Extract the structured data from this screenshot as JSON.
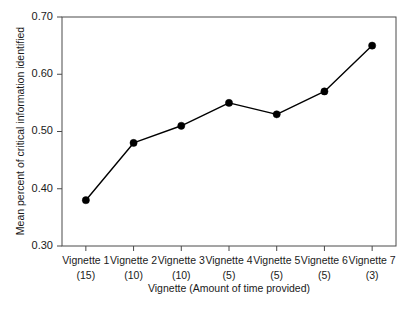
{
  "chart_data": {
    "type": "line",
    "title": "",
    "xlabel": "Vignette (Amount of time provided)",
    "ylabel": "Mean percent of critical information identified",
    "categories": [
      "Vignette 1",
      "Vignette 2",
      "Vignette 3",
      "Vignette 4",
      "Vignette 5",
      "Vignette 6",
      "Vignette 7"
    ],
    "category_sublabels": [
      "(15)",
      "(10)",
      "(10)",
      "(5)",
      "(5)",
      "(5)",
      "(3)"
    ],
    "time_provided": [
      15,
      10,
      10,
      5,
      5,
      5,
      3
    ],
    "values": [
      0.38,
      0.48,
      0.51,
      0.55,
      0.53,
      0.57,
      0.65
    ],
    "ylim": [
      0.3,
      0.7
    ],
    "ytick_labels": [
      "0.30",
      "0.40",
      "0.50",
      "0.60",
      "0.70"
    ],
    "ytick_values": [
      0.3,
      0.4,
      0.5,
      0.6,
      0.7
    ],
    "grid": false,
    "legend": "none",
    "marker": "filled-circle",
    "line_color": "#000000",
    "marker_color": "#000000",
    "frame_color": "#4a4a4a",
    "background": "#ffffff"
  },
  "figure": {
    "plot_left": 62,
    "plot_right": 396,
    "plot_top": 17,
    "plot_bottom": 246
  }
}
